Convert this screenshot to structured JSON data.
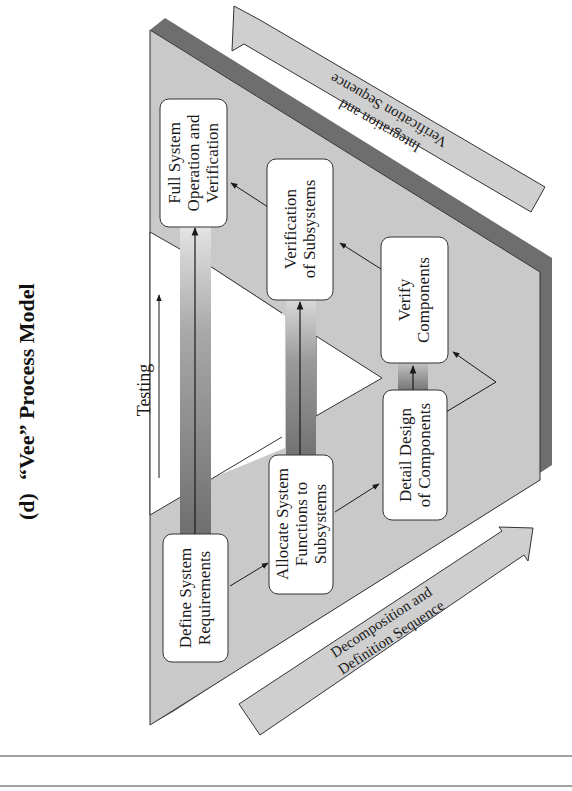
{
  "figure": {
    "label": "(d)",
    "title": "“Vee” Process Model",
    "orientation": "rotated 90deg counter-clockwise"
  },
  "colors": {
    "vee_fill": "#c9c9c9",
    "vee_shadow": "#6e6e6e",
    "band_fill": "#cfcfcf",
    "box_fill": "#ffffff",
    "stroke": "#333333",
    "bar_dark": "#7a7a7a",
    "bar_light": "#d6d6d6"
  },
  "left_arm": {
    "boxes": [
      {
        "id": "define-system-requirements",
        "lines": [
          "Define System",
          "Requirements"
        ]
      },
      {
        "id": "allocate-system-functions",
        "lines": [
          "Allocate System",
          "Functions to",
          "Subsystems"
        ]
      },
      {
        "id": "detail-design-components",
        "lines": [
          "Detail Design",
          "of Components"
        ]
      }
    ]
  },
  "right_arm": {
    "boxes": [
      {
        "id": "verify-components",
        "lines": [
          "Verify",
          "Components"
        ]
      },
      {
        "id": "verification-subsystems",
        "lines": [
          "Verification",
          "of Subsystems"
        ]
      },
      {
        "id": "full-system-operation",
        "lines": [
          "Full System",
          "Operation and",
          "Verification"
        ]
      }
    ]
  },
  "testing": {
    "label": "Testing"
  },
  "bands": {
    "decomposition": {
      "lines": [
        "Decomposition and",
        "Definition Sequence"
      ]
    },
    "integration": {
      "lines": [
        "Integration and",
        "Verification Sequence"
      ]
    }
  }
}
